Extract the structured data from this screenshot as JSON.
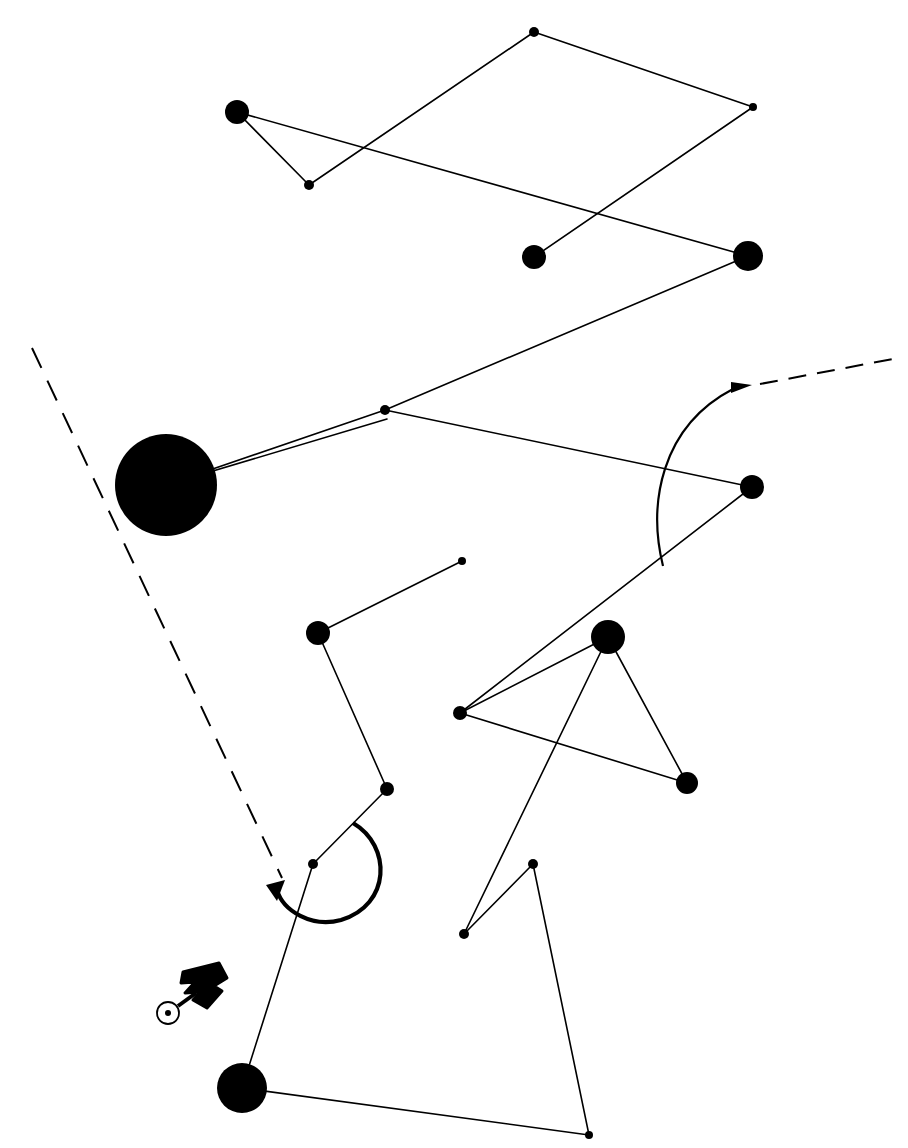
{
  "figure": {
    "width": 908,
    "height": 1148,
    "background_color": "#ffffff",
    "ink_color": "#000000"
  },
  "chart_data": {
    "type": "scatter",
    "title": "",
    "xlabel": "",
    "ylabel": "",
    "xlim": [
      0,
      908
    ],
    "ylim": [
      0,
      1148
    ],
    "grid": false,
    "legend": "none",
    "nodes": [
      {
        "id": "n1",
        "x": 237,
        "y": 112,
        "r": 12,
        "style": "filled"
      },
      {
        "id": "n2",
        "x": 309,
        "y": 185,
        "r": 5,
        "style": "filled"
      },
      {
        "id": "n3",
        "x": 534,
        "y": 32,
        "r": 5,
        "style": "filled"
      },
      {
        "id": "n4",
        "x": 753,
        "y": 107,
        "r": 4,
        "style": "filled"
      },
      {
        "id": "n5",
        "x": 534,
        "y": 257,
        "r": 12,
        "style": "filled"
      },
      {
        "id": "n6",
        "x": 748,
        "y": 256,
        "r": 15,
        "style": "filled"
      },
      {
        "id": "n7",
        "x": 385,
        "y": 410,
        "r": 5,
        "style": "filled"
      },
      {
        "id": "n8",
        "x": 166,
        "y": 485,
        "r": 51,
        "style": "filled"
      },
      {
        "id": "n9",
        "x": 752,
        "y": 487,
        "r": 12,
        "style": "filled"
      },
      {
        "id": "n10",
        "x": 462,
        "y": 561,
        "r": 4,
        "style": "filled"
      },
      {
        "id": "n11",
        "x": 318,
        "y": 633,
        "r": 12,
        "style": "filled"
      },
      {
        "id": "n12",
        "x": 608,
        "y": 637,
        "r": 17,
        "style": "filled"
      },
      {
        "id": "n13",
        "x": 460,
        "y": 713,
        "r": 7,
        "style": "filled"
      },
      {
        "id": "n14",
        "x": 687,
        "y": 783,
        "r": 11,
        "style": "filled"
      },
      {
        "id": "n15",
        "x": 387,
        "y": 789,
        "r": 7,
        "style": "filled"
      },
      {
        "id": "n16",
        "x": 313,
        "y": 864,
        "r": 5,
        "style": "filled"
      },
      {
        "id": "n17",
        "x": 533,
        "y": 864,
        "r": 5,
        "style": "filled"
      },
      {
        "id": "n18",
        "x": 464,
        "y": 934,
        "r": 5,
        "style": "filled"
      },
      {
        "id": "n19",
        "x": 242,
        "y": 1088,
        "r": 25,
        "style": "filled"
      },
      {
        "id": "n20",
        "x": 589,
        "y": 1135,
        "r": 4,
        "style": "filled"
      }
    ],
    "edges": [
      {
        "from": "n1",
        "to": "n2",
        "kind": "solid"
      },
      {
        "from": "n1",
        "to": "n6",
        "kind": "solid"
      },
      {
        "from": "n2",
        "to": "n3",
        "kind": "solid"
      },
      {
        "from": "n3",
        "to": "n4",
        "kind": "solid"
      },
      {
        "from": "n4",
        "to": "n5",
        "kind": "solid"
      },
      {
        "from": "n6",
        "to": "n7",
        "kind": "solid"
      },
      {
        "from": "n7",
        "to": "n8",
        "kind": "solid"
      },
      {
        "from": "n8",
        "to": "n7b",
        "kind": "solid"
      },
      {
        "from": "n7",
        "to": "n9",
        "kind": "solid"
      },
      {
        "from": "n9",
        "to": "n13",
        "kind": "solid"
      },
      {
        "from": "n10",
        "to": "n11",
        "kind": "solid"
      },
      {
        "from": "n11",
        "to": "n15",
        "kind": "solid"
      },
      {
        "from": "n15",
        "to": "n16",
        "kind": "solid"
      },
      {
        "from": "n16",
        "to": "n19",
        "kind": "solid"
      },
      {
        "from": "n13",
        "to": "n12",
        "kind": "solid"
      },
      {
        "from": "n12",
        "to": "n14",
        "kind": "solid"
      },
      {
        "from": "n13",
        "to": "n14",
        "kind": "solid"
      },
      {
        "from": "n12",
        "to": "n18",
        "kind": "solid"
      },
      {
        "from": "n18",
        "to": "n17",
        "kind": "solid"
      },
      {
        "from": "n17",
        "to": "n20",
        "kind": "solid"
      },
      {
        "from": "n19",
        "to": "n20",
        "kind": "solid"
      }
    ],
    "dashed_lines": [
      {
        "id": "d1",
        "x1": 32,
        "y1": 348,
        "x2": 282,
        "y2": 878,
        "dash": "22 14"
      },
      {
        "id": "d2",
        "x1": 760,
        "y1": 384,
        "x2": 893,
        "y2": 359,
        "dash": "18 11"
      }
    ],
    "arcs": [
      {
        "id": "arc-right",
        "label": "curved arrow sweeping up to dashed tail",
        "arrowhead_at": [
          748,
          385
        ]
      },
      {
        "id": "arc-lower",
        "label": "bold curved arrow sweeping counterclockwise",
        "arrowhead_at": [
          268,
          887
        ]
      }
    ],
    "markers": [
      {
        "id": "m1",
        "type": "circle-with-dot",
        "x": 168,
        "y": 1013,
        "r": 11,
        "dot_r": 3
      },
      {
        "id": "m2",
        "type": "bold-arrow-glyph",
        "x": 205,
        "y": 985,
        "label": "R-like bold arrow pointer"
      }
    ]
  }
}
